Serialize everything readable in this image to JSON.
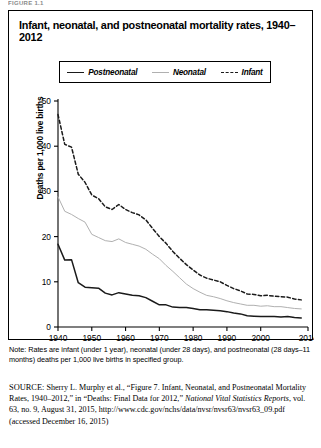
{
  "figure_label": "FIGURE 1.1",
  "title": "Infant, neonatal, and postneonatal mortality rates, 1940–2012",
  "legend": {
    "items": [
      {
        "label": "Postneonatal",
        "style": "solid-thick-black",
        "color": "#1a1a1a"
      },
      {
        "label": "Neonatal",
        "style": "solid-thin-gray",
        "color": "#b0b0b0"
      },
      {
        "label": "Infant",
        "style": "dashed-black",
        "color": "#1a1a1a"
      }
    ]
  },
  "note": {
    "line1": "Note: Rates are infant (under 1 year), neonatal (under 28 days), and postneonatal",
    "line2": "(28 days–11 months) deaths per 1,000 live births in specified group."
  },
  "source": {
    "label": "SOURCE:",
    "text_1": " Sherry L. Murphy et al., “Figure 7. Infant, Neonatal, and Postneonatal Mortality Rates, 1940–2012,” in “Deaths: Final Data for 2012,” ",
    "italic_1": "National Vital Statistics Reports",
    "text_2": ", vol. 63, no. 9, August 31, 2015, http://www.cdc.gov/nchs/data/nvsr/nvsr63/nvsr63_09.pdf (accessed December 16, 2015)"
  },
  "chart_data": {
    "type": "line",
    "title": "Infant, neonatal, and postneonatal mortality rates, 1940–2012",
    "xlabel": "",
    "ylabel": "Deaths per 1,000 live births",
    "xlim": [
      1940,
      2014
    ],
    "ylim": [
      0,
      50
    ],
    "yticks": [
      0,
      10,
      20,
      30,
      40,
      50
    ],
    "xticks": [
      1940,
      1950,
      1960,
      1970,
      1980,
      1990,
      2000,
      2014
    ],
    "grid": false,
    "legend_position": "top-center-boxed",
    "x": [
      1940,
      1942,
      1944,
      1946,
      1948,
      1950,
      1952,
      1954,
      1956,
      1958,
      1960,
      1962,
      1964,
      1966,
      1968,
      1970,
      1972,
      1974,
      1976,
      1978,
      1980,
      1982,
      1984,
      1986,
      1988,
      1990,
      1992,
      1994,
      1996,
      1998,
      2000,
      2002,
      2004,
      2006,
      2008,
      2010,
      2012
    ],
    "series": [
      {
        "name": "Infant",
        "color": "#1a1a1a",
        "style": "dashed",
        "values": [
          47.0,
          40.4,
          39.8,
          33.8,
          32.0,
          29.2,
          28.4,
          26.6,
          26.0,
          27.1,
          26.0,
          25.3,
          24.8,
          23.7,
          21.8,
          20.0,
          18.5,
          16.7,
          15.2,
          13.8,
          12.6,
          11.5,
          10.8,
          10.4,
          10.0,
          9.2,
          8.5,
          8.0,
          7.3,
          7.2,
          6.9,
          7.0,
          6.8,
          6.7,
          6.6,
          6.2,
          6.0
        ]
      },
      {
        "name": "Neonatal",
        "color": "#b0b0b0",
        "style": "solid",
        "values": [
          28.8,
          25.6,
          24.9,
          24.0,
          23.2,
          20.5,
          19.8,
          19.1,
          18.9,
          19.5,
          18.7,
          18.3,
          17.9,
          17.2,
          16.1,
          15.1,
          13.6,
          12.3,
          10.9,
          9.5,
          8.5,
          7.7,
          7.0,
          6.7,
          6.3,
          5.8,
          5.4,
          5.1,
          4.8,
          4.8,
          4.6,
          4.7,
          4.5,
          4.5,
          4.3,
          4.1,
          4.0
        ]
      },
      {
        "name": "Postneonatal",
        "color": "#1a1a1a",
        "style": "solid",
        "values": [
          18.3,
          14.8,
          14.9,
          9.8,
          8.8,
          8.7,
          8.6,
          7.5,
          7.1,
          7.6,
          7.3,
          7.0,
          6.9,
          6.5,
          5.7,
          4.9,
          4.9,
          4.4,
          4.3,
          4.3,
          4.1,
          3.8,
          3.8,
          3.7,
          3.6,
          3.4,
          3.1,
          2.9,
          2.5,
          2.4,
          2.3,
          2.3,
          2.3,
          2.2,
          2.3,
          2.1,
          2.0
        ]
      }
    ]
  }
}
